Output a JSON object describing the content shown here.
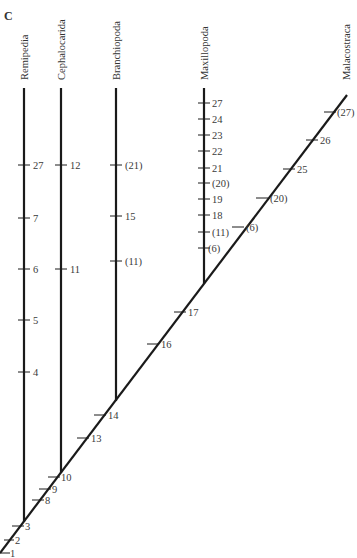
{
  "panel_label": "C",
  "taxa": [
    {
      "name": "Remipedia"
    },
    {
      "name": "Cephalocarida"
    },
    {
      "name": "Branchiopoda"
    },
    {
      "name": "Maxillopoda"
    },
    {
      "name": "Malacostraca"
    }
  ],
  "branch_characters": {
    "Remipedia": [
      "4",
      "5",
      "6",
      "7",
      "27"
    ],
    "Cephalocarida": [
      "11",
      "12"
    ],
    "Branchiopoda": [
      "(11)",
      "15",
      "(21)"
    ],
    "Maxillopoda": [
      "(6)",
      "(11)",
      "18",
      "19",
      "(20)",
      "21",
      "22",
      "23",
      "24",
      "27"
    ],
    "main_stem": [
      "1",
      "2",
      "3",
      "8",
      "9",
      "10",
      "13",
      "14",
      "16",
      "17"
    ],
    "Malacostraca": [
      "(6)",
      "(20)",
      "25",
      "26",
      "(27)"
    ]
  },
  "colors": {
    "line": "#1a1a1a",
    "text": "#3a3a3a",
    "background": "#ffffff"
  }
}
